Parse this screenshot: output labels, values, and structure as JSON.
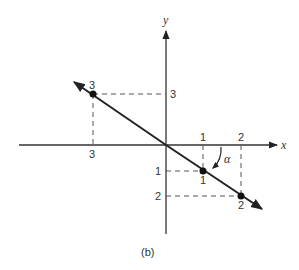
{
  "figure": {
    "caption": "(b)",
    "axes": {
      "x_label": "x",
      "y_label": "y"
    },
    "tick_labels": {
      "x_pos_1": "1",
      "x_pos_2": "2",
      "x_neg_3": "3",
      "y_pos_3": "3",
      "y_neg_1": "1",
      "y_neg_2": "2"
    },
    "points": [
      {
        "label": "3",
        "x": -3,
        "y": 3
      },
      {
        "label": "1",
        "x": 1,
        "y": -1
      },
      {
        "label": "2",
        "x": 2,
        "y": -2
      }
    ],
    "angle_label": "α",
    "colors": {
      "ink": "#333333",
      "line": "#222222",
      "dash": "#555555",
      "background": "#ffffff"
    }
  }
}
